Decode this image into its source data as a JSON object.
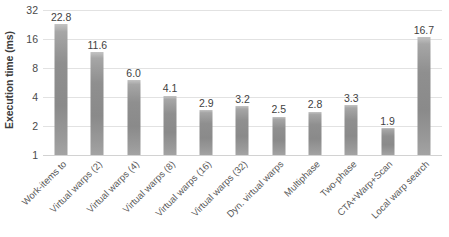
{
  "chart_data": {
    "type": "bar",
    "title": "",
    "xlabel": "",
    "ylabel": "Execution time (ms)",
    "yscale": "log2",
    "ylim": [
      1,
      32
    ],
    "yticks": [
      1,
      2,
      4,
      8,
      16,
      32
    ],
    "ytick_labels": [
      "1",
      "2",
      "4",
      "8",
      "16",
      "32"
    ],
    "grid": true,
    "legend": "none",
    "bar_color": "#949494",
    "categories": [
      "Work-items to",
      "Virtual warps (2)",
      "Virtual warps (4)",
      "Virtual warps (8)",
      "Virtual warps (16)",
      "Virtual warps (32)",
      "Dyn. virtual warps",
      "Multiphase",
      "Two-phase",
      "CTA+Warp+Scan",
      "Local warp search"
    ],
    "values": [
      22.8,
      11.6,
      6.0,
      4.1,
      2.9,
      3.2,
      2.5,
      2.8,
      3.3,
      1.9,
      16.7
    ],
    "data_labels": [
      "22.8",
      "11.6",
      "6.0",
      "4.1",
      "2.9",
      "3.2",
      "2.5",
      "2.8",
      "3.3",
      "1.9",
      "16.7"
    ]
  }
}
